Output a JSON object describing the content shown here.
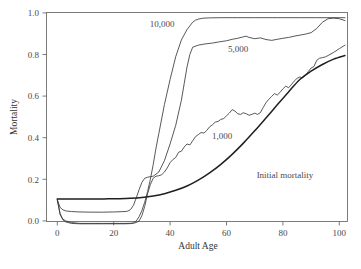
{
  "chart_data": {
    "type": "line",
    "title": "",
    "xlabel": "Adult Age",
    "ylabel": "Mortality",
    "xlim": [
      0,
      104
    ],
    "ylim": [
      -0.04,
      1.0
    ],
    "grid": false,
    "legend_position": "inline-annotations",
    "xticks": [
      0,
      20,
      40,
      60,
      80,
      100
    ],
    "xtick_labels": [
      "0",
      "20",
      "40",
      "60",
      "80",
      "100"
    ],
    "yticks": [
      0.0,
      0.2,
      0.4,
      0.6,
      0.8,
      1.0
    ],
    "ytick_labels": [
      "0.0",
      "0.2",
      "0.4",
      "0.6",
      "0.8",
      "1.0"
    ],
    "annotations": [
      {
        "text": "10,000",
        "x": 42,
        "y": 0.93
      },
      {
        "text": "5,000",
        "x": 68,
        "y": 0.81
      },
      {
        "text": "1,000",
        "x": 62,
        "y": 0.41
      },
      {
        "text": "Initial mortality",
        "x": 78,
        "y": 0.21
      }
    ],
    "series": [
      {
        "name": "10,000",
        "style": "thin",
        "x": [
          0,
          1,
          2,
          3,
          5,
          8,
          12,
          16,
          20,
          24,
          26,
          27,
          28,
          29,
          30,
          31,
          32,
          33,
          34,
          35,
          36,
          38,
          40,
          42,
          44,
          46,
          48,
          49,
          50,
          51,
          52,
          54,
          58,
          64,
          70,
          78,
          86,
          92,
          96,
          100,
          102
        ],
        "y": [
          0.1,
          0.03,
          0.005,
          -0.005,
          -0.012,
          -0.014,
          -0.014,
          -0.014,
          -0.014,
          -0.014,
          -0.013,
          -0.01,
          0.0,
          0.02,
          0.05,
          0.09,
          0.14,
          0.2,
          0.27,
          0.35,
          0.42,
          0.56,
          0.68,
          0.79,
          0.87,
          0.92,
          0.955,
          0.965,
          0.97,
          0.973,
          0.975,
          0.976,
          0.977,
          0.977,
          0.977,
          0.977,
          0.977,
          0.977,
          0.977,
          0.977,
          0.977
        ]
      },
      {
        "name": "5,000",
        "style": "thin",
        "x": [
          0,
          1,
          2,
          3,
          5,
          8,
          12,
          16,
          20,
          24,
          25,
          26,
          27,
          28,
          29,
          30,
          31,
          32,
          34,
          36,
          38,
          40,
          42,
          44,
          45,
          46,
          47,
          48,
          50,
          52,
          55,
          58,
          60,
          62,
          64,
          66,
          67,
          68,
          70,
          72,
          74,
          76,
          78,
          80,
          82,
          84,
          86,
          88,
          90,
          92,
          94,
          96,
          98,
          100,
          102
        ],
        "y": [
          0.1,
          0.065,
          0.053,
          0.048,
          0.045,
          0.043,
          0.042,
          0.042,
          0.043,
          0.045,
          0.047,
          0.055,
          0.075,
          0.11,
          0.15,
          0.185,
          0.205,
          0.21,
          0.215,
          0.235,
          0.29,
          0.37,
          0.46,
          0.58,
          0.66,
          0.74,
          0.8,
          0.835,
          0.845,
          0.85,
          0.855,
          0.862,
          0.866,
          0.873,
          0.878,
          0.885,
          0.888,
          0.882,
          0.876,
          0.88,
          0.872,
          0.868,
          0.873,
          0.878,
          0.882,
          0.888,
          0.893,
          0.898,
          0.905,
          0.925,
          0.955,
          0.972,
          0.975,
          0.972,
          0.963
        ]
      },
      {
        "name": "1,000",
        "style": "thin",
        "x": [
          0,
          1,
          2,
          3,
          5,
          8,
          12,
          16,
          20,
          24,
          27,
          28,
          29,
          30,
          31,
          32,
          33,
          34,
          35,
          36,
          37,
          38,
          39,
          40,
          41,
          42,
          43,
          44,
          45,
          46,
          47,
          48,
          49,
          50,
          51,
          52,
          53,
          54,
          55,
          56,
          57,
          58,
          59,
          60,
          61,
          62,
          63,
          64,
          65,
          66,
          67,
          68,
          69,
          70,
          71,
          72,
          73,
          74,
          75,
          76,
          77,
          78,
          79,
          80,
          81,
          82,
          83,
          84,
          85,
          86,
          87,
          88,
          89,
          90,
          91,
          92,
          93,
          94,
          95,
          96,
          98,
          100,
          102
        ],
        "y": [
          0.105,
          0.035,
          0.008,
          0.0,
          -0.008,
          -0.012,
          -0.012,
          -0.012,
          -0.012,
          -0.012,
          -0.011,
          -0.008,
          0.0,
          0.025,
          0.07,
          0.13,
          0.175,
          0.205,
          0.215,
          0.217,
          0.222,
          0.235,
          0.255,
          0.28,
          0.295,
          0.305,
          0.33,
          0.335,
          0.355,
          0.37,
          0.365,
          0.385,
          0.405,
          0.415,
          0.425,
          0.422,
          0.435,
          0.452,
          0.462,
          0.475,
          0.478,
          0.488,
          0.492,
          0.505,
          0.518,
          0.535,
          0.528,
          0.515,
          0.512,
          0.52,
          0.515,
          0.508,
          0.512,
          0.518,
          0.512,
          0.52,
          0.545,
          0.568,
          0.585,
          0.598,
          0.612,
          0.605,
          0.618,
          0.635,
          0.648,
          0.64,
          0.655,
          0.672,
          0.685,
          0.692,
          0.688,
          0.7,
          0.718,
          0.735,
          0.742,
          0.772,
          0.782,
          0.785,
          0.788,
          0.795,
          0.81,
          0.828,
          0.845
        ]
      },
      {
        "name": "Initial mortality",
        "style": "thick",
        "x": [
          0,
          2,
          4,
          6,
          8,
          10,
          14,
          18,
          22,
          26,
          30,
          34,
          38,
          42,
          46,
          50,
          54,
          58,
          62,
          66,
          70,
          74,
          78,
          82,
          86,
          90,
          94,
          98,
          102
        ],
        "y": [
          0.105,
          0.105,
          0.105,
          0.105,
          0.105,
          0.105,
          0.105,
          0.106,
          0.107,
          0.109,
          0.113,
          0.12,
          0.131,
          0.147,
          0.168,
          0.196,
          0.231,
          0.272,
          0.32,
          0.374,
          0.433,
          0.495,
          0.558,
          0.62,
          0.68,
          0.72,
          0.752,
          0.778,
          0.795
        ]
      }
    ]
  },
  "caption": {
    "text": ""
  }
}
